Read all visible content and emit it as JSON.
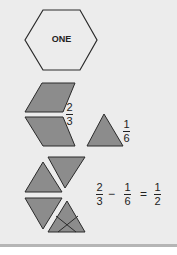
{
  "hexagon": {
    "label": "ONE"
  },
  "rhombi_fraction": {
    "numerator": "2",
    "denominator": "3"
  },
  "triangle_fraction": {
    "numerator": "1",
    "denominator": "6"
  },
  "equation": {
    "a": {
      "numerator": "2",
      "denominator": "3"
    },
    "minus": "−",
    "b": {
      "numerator": "1",
      "denominator": "6"
    },
    "equals": "=",
    "result": {
      "numerator": "1",
      "denominator": "2"
    }
  },
  "colors": {
    "shape_fill": "#8c8c8c",
    "hex_fill": "#ececec",
    "stroke": "#2a2a2a",
    "background": "#ececec"
  }
}
